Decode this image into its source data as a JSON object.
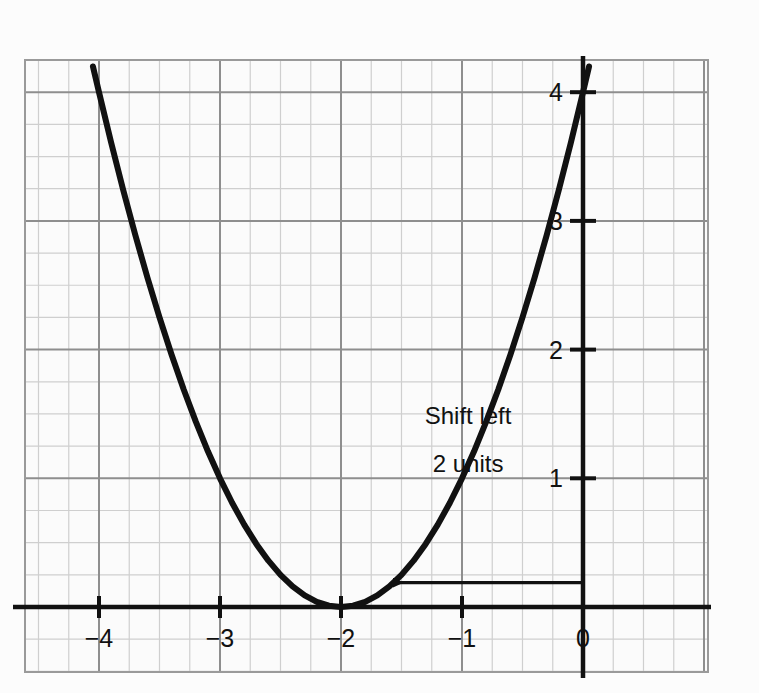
{
  "figure": {
    "background_color": "#fcfcfc",
    "plot_background_color": "#fbfbfb"
  },
  "chart_data": {
    "type": "line",
    "title": "",
    "subtitle": "",
    "xlabel": "x",
    "ylabel": "y",
    "xlim": [
      -4.55,
      1.05
    ],
    "ylim": [
      -0.6,
      4.25
    ],
    "grid": true,
    "minor_grid": true,
    "minor_ticks_per_unit": 4,
    "legend_position": "none",
    "x_tick_labels": [
      "−4",
      "−3",
      "−2",
      "−1",
      "0"
    ],
    "x_tick_values": [
      -4,
      -3,
      -2,
      -1,
      0
    ],
    "y_tick_labels": [
      "1",
      "2",
      "3",
      "4"
    ],
    "y_tick_values": [
      1,
      2,
      3,
      4
    ],
    "series": [
      {
        "name": "y = (x + 2)^2",
        "type": "line",
        "color": "#111111",
        "line_width": 6,
        "vertex": [
          -2,
          0
        ],
        "points": [
          [
            -4.05,
            4.2
          ],
          [
            -4.0,
            4.0
          ],
          [
            -3.9,
            3.61
          ],
          [
            -3.8,
            3.24
          ],
          [
            -3.7,
            2.89
          ],
          [
            -3.6,
            2.56
          ],
          [
            -3.5,
            2.25
          ],
          [
            -3.4,
            1.96
          ],
          [
            -3.3,
            1.69
          ],
          [
            -3.2,
            1.44
          ],
          [
            -3.1,
            1.21
          ],
          [
            -3.0,
            1.0
          ],
          [
            -2.9,
            0.81
          ],
          [
            -2.8,
            0.64
          ],
          [
            -2.7,
            0.49
          ],
          [
            -2.6,
            0.36
          ],
          [
            -2.5,
            0.25
          ],
          [
            -2.4,
            0.16
          ],
          [
            -2.3,
            0.09
          ],
          [
            -2.2,
            0.04
          ],
          [
            -2.1,
            0.01
          ],
          [
            -2.0,
            0.0
          ],
          [
            -1.9,
            0.01
          ],
          [
            -1.8,
            0.04
          ],
          [
            -1.7,
            0.09
          ],
          [
            -1.6,
            0.16
          ],
          [
            -1.5,
            0.25
          ],
          [
            -1.4,
            0.36
          ],
          [
            -1.3,
            0.49
          ],
          [
            -1.2,
            0.64
          ],
          [
            -1.1,
            0.81
          ],
          [
            -1.0,
            1.0
          ],
          [
            -0.9,
            1.21
          ],
          [
            -0.8,
            1.44
          ],
          [
            -0.7,
            1.69
          ],
          [
            -0.6,
            1.96
          ],
          [
            -0.5,
            2.25
          ],
          [
            -0.4,
            2.56
          ],
          [
            -0.3,
            2.89
          ],
          [
            -0.2,
            3.24
          ],
          [
            -0.1,
            3.61
          ],
          [
            0.0,
            4.0
          ],
          [
            0.05,
            4.2
          ]
        ]
      }
    ],
    "annotations": [
      {
        "name": "shift-annotation",
        "line1": "Shift left",
        "line2": "2 units",
        "text_x": -0.95,
        "text_y1": 1.42,
        "text_y2": 1.05,
        "arrow": {
          "from_x": 0.0,
          "from_y": 0.19,
          "to_x": -1.57,
          "to_y": 0.19,
          "direction": "left",
          "color": "#111111"
        }
      }
    ],
    "colors": {
      "curve": "#111111",
      "axis": "#111111",
      "major_grid": "#8e8e8e",
      "minor_grid": "#cfcfcf",
      "plot_border": "#8e8e8e",
      "text": "#111111"
    }
  }
}
